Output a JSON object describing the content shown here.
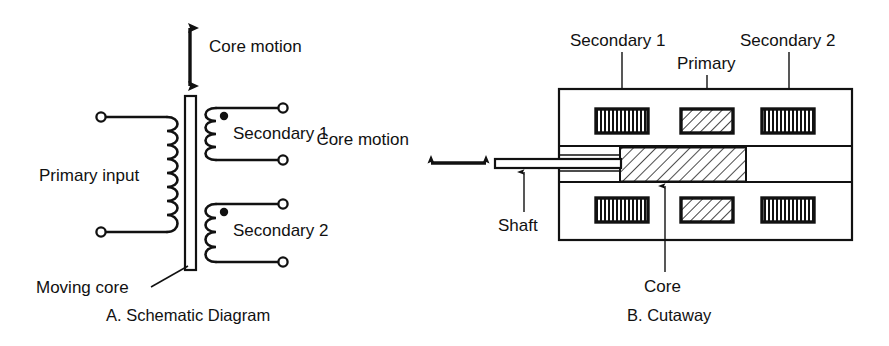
{
  "figure": {
    "background_color": "#ffffff",
    "line_color": "#111111",
    "panels": [
      {
        "id": "schematic",
        "caption": "A. Schematic Diagram",
        "labels": {
          "core_motion": "Core motion",
          "primary_input": "Primary input",
          "secondary_1": "Secondary 1",
          "secondary_2": "Secondary 2",
          "moving_core": "Moving core"
        }
      },
      {
        "id": "cutaway",
        "caption": "B. Cutaway",
        "labels": {
          "core_motion": "Core motion",
          "secondary_1": "Secondary 1",
          "primary": "Primary",
          "secondary_2": "Secondary 2",
          "shaft": "Shaft",
          "core": "Core"
        }
      }
    ]
  },
  "diagram_data": {
    "type": "technical-schematic",
    "subject": "LVDT (Linear Variable Differential Transformer)",
    "panel_a": {
      "core_bar": {
        "x": 185,
        "y": 96,
        "width": 11,
        "height": 174
      },
      "core_motion_arrow": {
        "x": 190,
        "y_top": 22,
        "y_bottom": 92,
        "double_headed": true,
        "orientation": "vertical"
      },
      "primary_coil": {
        "bumps": 8,
        "side": "left-of-core",
        "terminals": 2
      },
      "secondary_coils": [
        {
          "name": "Secondary 1",
          "bumps": 4,
          "dot_polarity": "top"
        },
        {
          "name": "Secondary 2",
          "bumps": 4,
          "dot_polarity": "top"
        }
      ],
      "terminal_marker": "open-circle"
    },
    "panel_b": {
      "housing": {
        "x": 559,
        "y": 89,
        "width": 293,
        "height": 151
      },
      "bore_channel": {
        "y_top": 146,
        "y_bottom": 182
      },
      "core_block": {
        "x": 620,
        "y": 148,
        "width": 126,
        "height": 33,
        "fill": "diagonal-hatch"
      },
      "shaft": {
        "x": 495,
        "y": 159,
        "width": 126,
        "height": 8
      },
      "core_motion_arrow": {
        "y": 163,
        "x_left": 425,
        "x_right": 490,
        "double_headed": true,
        "orientation": "horizontal"
      },
      "windings_top": [
        {
          "name": "Secondary 1",
          "x": 596,
          "y": 109,
          "width": 52,
          "height": 24,
          "fill": "vertical-stripe"
        },
        {
          "name": "Primary",
          "x": 681,
          "y": 109,
          "width": 52,
          "height": 24,
          "fill": "diagonal-hatch"
        },
        {
          "name": "Secondary 2",
          "x": 762,
          "y": 109,
          "width": 52,
          "height": 24,
          "fill": "vertical-stripe"
        }
      ],
      "windings_bottom": [
        {
          "name": "Secondary 1",
          "x": 596,
          "y": 198,
          "width": 52,
          "height": 24,
          "fill": "vertical-stripe"
        },
        {
          "name": "Primary",
          "x": 681,
          "y": 198,
          "width": 52,
          "height": 24,
          "fill": "diagonal-hatch"
        },
        {
          "name": "Secondary 2",
          "x": 762,
          "y": 198,
          "width": 52,
          "height": 24,
          "fill": "vertical-stripe"
        }
      ]
    }
  }
}
